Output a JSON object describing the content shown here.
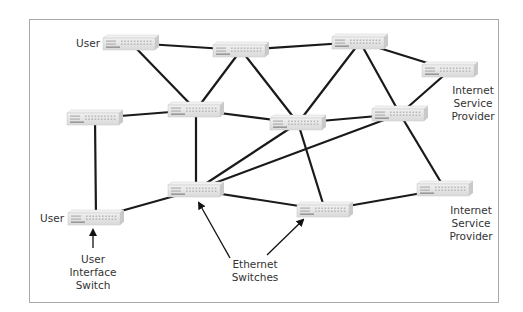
{
  "diagram": {
    "title": "",
    "type": "network-topology",
    "frame": {
      "x": 29,
      "y": 19,
      "w": 469,
      "h": 283,
      "stroke": "#aaaaaa"
    },
    "colors": {
      "link": "#1a1a1a",
      "switch_top": "#f2f2f2",
      "switch_front": "#e4e4e4",
      "switch_side": "#c9c9c9",
      "switch_stripe": "#888888",
      "text": "#333333"
    },
    "nodes": [
      {
        "id": "S1",
        "kind": "ethernet-switch",
        "cx": 131,
        "cy": 43
      },
      {
        "id": "S2",
        "kind": "ethernet-switch",
        "cx": 241,
        "cy": 50
      },
      {
        "id": "S3",
        "kind": "ethernet-switch",
        "cx": 360,
        "cy": 42
      },
      {
        "id": "S4",
        "kind": "ethernet-switch",
        "cx": 450,
        "cy": 70
      },
      {
        "id": "S5",
        "kind": "ethernet-switch",
        "cx": 95,
        "cy": 118
      },
      {
        "id": "S6",
        "kind": "ethernet-switch",
        "cx": 196,
        "cy": 110
      },
      {
        "id": "S7",
        "kind": "ethernet-switch",
        "cx": 298,
        "cy": 123
      },
      {
        "id": "S8",
        "kind": "ethernet-switch",
        "cx": 400,
        "cy": 114
      },
      {
        "id": "S9",
        "kind": "ethernet-switch",
        "cx": 196,
        "cy": 190
      },
      {
        "id": "S10",
        "kind": "ethernet-switch",
        "cx": 96,
        "cy": 218
      },
      {
        "id": "S11",
        "kind": "ethernet-switch",
        "cx": 325,
        "cy": 210
      },
      {
        "id": "S12",
        "kind": "ethernet-switch",
        "cx": 445,
        "cy": 189
      }
    ],
    "edges": [
      [
        "S1",
        "S2"
      ],
      [
        "S1",
        "S6"
      ],
      [
        "S2",
        "S3"
      ],
      [
        "S2",
        "S6"
      ],
      [
        "S2",
        "S7"
      ],
      [
        "S3",
        "S4"
      ],
      [
        "S3",
        "S7"
      ],
      [
        "S3",
        "S8"
      ],
      [
        "S4",
        "S8"
      ],
      [
        "S5",
        "S6"
      ],
      [
        "S5",
        "S10"
      ],
      [
        "S6",
        "S7"
      ],
      [
        "S6",
        "S9"
      ],
      [
        "S7",
        "S8"
      ],
      [
        "S7",
        "S11"
      ],
      [
        "S9",
        "S7"
      ],
      [
        "S9",
        "S8"
      ],
      [
        "S9",
        "S10"
      ],
      [
        "S9",
        "S11"
      ],
      [
        "S8",
        "S12"
      ],
      [
        "S11",
        "S12"
      ]
    ],
    "labels": [
      {
        "id": "user-top",
        "lines": [
          "User"
        ],
        "x": 72,
        "y": 37,
        "w": 28,
        "align": "right"
      },
      {
        "id": "user-bottom",
        "lines": [
          "User"
        ],
        "x": 36,
        "y": 212,
        "w": 28,
        "align": "right"
      },
      {
        "id": "isp-top",
        "lines": [
          "Internet",
          "Service",
          "Provider"
        ],
        "x": 443,
        "y": 84,
        "w": 60,
        "align": "center"
      },
      {
        "id": "isp-bottom",
        "lines": [
          "Internet",
          "Service",
          "Provider"
        ],
        "x": 441,
        "y": 204,
        "w": 60,
        "align": "center"
      },
      {
        "id": "user-interface-switch",
        "lines": [
          "User",
          "Interface",
          "Switch"
        ],
        "x": 63,
        "y": 253,
        "w": 60,
        "align": "center"
      },
      {
        "id": "ethernet-switches",
        "lines": [
          "Ethernet",
          "Switches"
        ],
        "x": 220,
        "y": 258,
        "w": 70,
        "align": "center"
      }
    ],
    "arrows": [
      {
        "id": "arrow-user-interface",
        "from": [
          93,
          248
        ],
        "to": [
          93,
          230
        ]
      },
      {
        "id": "arrow-eth-left",
        "from": [
          230,
          258
        ],
        "to": [
          199,
          203
        ]
      },
      {
        "id": "arrow-eth-right",
        "from": [
          267,
          255
        ],
        "to": [
          303,
          220
        ]
      }
    ]
  }
}
